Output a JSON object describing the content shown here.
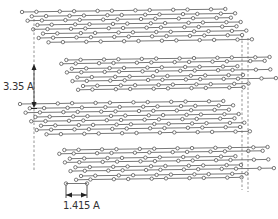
{
  "labels": {
    "interlayer_spacing": "3.35 A",
    "bond_length": "1.415 A"
  },
  "structure": {
    "layer_count": 4,
    "lattice": "hexagonal honeycomb",
    "stacking": "ABAB"
  },
  "colors": {
    "bond": "#555555",
    "atom_stroke": "#444444",
    "atom_fill": "#ffffff",
    "guide": "#666666",
    "text": "#333333"
  }
}
